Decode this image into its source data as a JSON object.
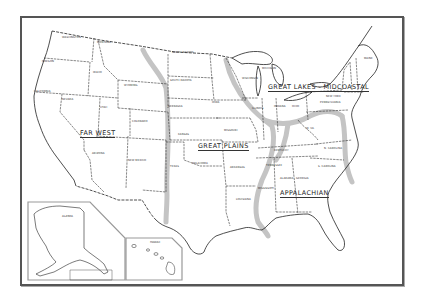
{
  "map": {
    "subject": "United States regional map",
    "colors": {
      "background": "#ffffff",
      "lines": "#222222",
      "corridor_shading": "#c4c4c4",
      "frame": "#555555"
    },
    "regions": [
      {
        "id": "far-west",
        "label": "FAR WEST"
      },
      {
        "id": "great-plains",
        "label": "GREAT PLAINS"
      },
      {
        "id": "great-lakes-midcoastal",
        "label": "GREAT LAKES - MIDCOASTAL"
      },
      {
        "id": "appalachian",
        "label": "APPALACHIAN"
      }
    ],
    "states": [
      {
        "label": "WASHINGTON"
      },
      {
        "label": "MONTANA"
      },
      {
        "label": "OREGON"
      },
      {
        "label": "IDAHO"
      },
      {
        "label": "WYOMING"
      },
      {
        "label": "NORTH DAKOTA"
      },
      {
        "label": "SOUTH DAKOTA"
      },
      {
        "label": "NEBRASKA"
      },
      {
        "label": "CALIFORNIA"
      },
      {
        "label": "NEVADA"
      },
      {
        "label": "UTAH"
      },
      {
        "label": "COLORADO"
      },
      {
        "label": "KANSAS"
      },
      {
        "label": "ARIZONA"
      },
      {
        "label": "NEW MEXICO"
      },
      {
        "label": "OKLAHOMA"
      },
      {
        "label": "TEXAS"
      },
      {
        "label": "IOWA"
      },
      {
        "label": "MISSOURI"
      },
      {
        "label": "ARKANSAS"
      },
      {
        "label": "LOUISIANA"
      },
      {
        "label": "WISCONSIN"
      },
      {
        "label": "MICHIGAN"
      },
      {
        "label": "ILLINOIS"
      },
      {
        "label": "INDIANA"
      },
      {
        "label": "OHIO"
      },
      {
        "label": "KENTUCKY"
      },
      {
        "label": "TENNESSEE"
      },
      {
        "label": "MISSISSIPPI"
      },
      {
        "label": "ALABAMA"
      },
      {
        "label": "GEORGIA"
      },
      {
        "label": "N. CAROLINA"
      },
      {
        "label": "S. CAROLINA"
      },
      {
        "label": "W. VA."
      },
      {
        "label": "NEW YORK"
      },
      {
        "label": "PENNSYLVANIA"
      },
      {
        "label": "MAINE"
      }
    ],
    "insets": [
      {
        "id": "alaska",
        "label": "ALASKA"
      },
      {
        "id": "hawaii",
        "label": "HAWAII"
      }
    ]
  }
}
